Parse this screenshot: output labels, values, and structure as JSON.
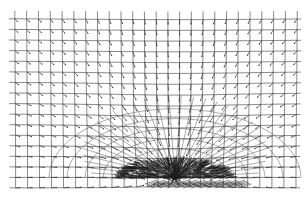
{
  "figure": {
    "type": "vector-field-mesh",
    "colors": {
      "background": "#ffffff",
      "grid": "#555555",
      "arrows": "#222222",
      "dense_region": "#1a1a1a"
    }
  },
  "grid": {
    "x_start": 14,
    "x_end": 298,
    "y_start": 18,
    "y_end": 188,
    "columns": 24,
    "rows": 16
  },
  "singularity": {
    "cx": 175,
    "cy": 178,
    "rx": 60,
    "ry": 22
  },
  "rays": {
    "count": 34,
    "length": 110
  }
}
